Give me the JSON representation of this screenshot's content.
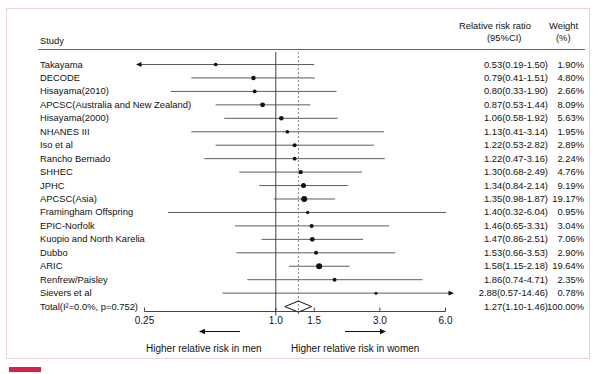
{
  "figure": {
    "column_headers": {
      "study": "Study",
      "effect_line1": "Relative risk ratio",
      "effect_line2": "(95%CI)",
      "weight_line1": "Weight",
      "weight_line2": "(%)"
    },
    "footer": {
      "left_label": "Higher relative risk in men",
      "right_label": "Higher relative risk in women"
    }
  },
  "chart_data": {
    "type": "forest",
    "title": "",
    "xlabel": "",
    "ylabel": "",
    "scale": "log",
    "xlim": [
      0.25,
      6.0
    ],
    "xticks": [
      0.25,
      1.0,
      1.5,
      3.0,
      6.0
    ],
    "xticklabels": [
      "0.25",
      "1.0",
      "1.5",
      "3.0",
      "6.0"
    ],
    "null_line": 1.0,
    "summary_line": 1.27,
    "grid": false,
    "legend": "none",
    "heterogeneity": "I²=0.0%, p=0.752",
    "studies": [
      {
        "label": "Takayama",
        "effect": 0.53,
        "lower": 0.19,
        "upper": 1.5,
        "weight": 1.9,
        "effect_text": "0.53(0.19-1.50)",
        "weight_text": "1.90%"
      },
      {
        "label": "DECODE",
        "effect": 0.79,
        "lower": 0.41,
        "upper": 1.51,
        "weight": 4.8,
        "effect_text": "0.79(0.41-1.51)",
        "weight_text": "4.80%"
      },
      {
        "label": "Hisayama(2010)",
        "effect": 0.8,
        "lower": 0.33,
        "upper": 1.9,
        "weight": 2.66,
        "effect_text": "0.80(0.33-1.90)",
        "weight_text": "2.66%"
      },
      {
        "label": "APCSC(Australia and New Zealand)",
        "effect": 0.87,
        "lower": 0.53,
        "upper": 1.44,
        "weight": 8.09,
        "effect_text": "0.87(0.53-1.44)",
        "weight_text": "8.09%"
      },
      {
        "label": "Hisayama(2000)",
        "effect": 1.06,
        "lower": 0.58,
        "upper": 1.92,
        "weight": 5.63,
        "effect_text": "1.06(0.58-1.92)",
        "weight_text": "5.63%"
      },
      {
        "label": "NHANES III",
        "effect": 1.13,
        "lower": 0.41,
        "upper": 3.14,
        "weight": 1.95,
        "effect_text": "1.13(0.41-3.14)",
        "weight_text": "1.95%"
      },
      {
        "label": "Iso et al",
        "effect": 1.22,
        "lower": 0.53,
        "upper": 2.82,
        "weight": 2.89,
        "effect_text": "1.22(0.53-2.82)",
        "weight_text": "2.89%"
      },
      {
        "label": "Rancho Bernado",
        "effect": 1.22,
        "lower": 0.47,
        "upper": 3.16,
        "weight": 2.24,
        "effect_text": "1.22(0.47-3.16)",
        "weight_text": "2.24%"
      },
      {
        "label": "SHHEC",
        "effect": 1.3,
        "lower": 0.68,
        "upper": 2.49,
        "weight": 4.76,
        "effect_text": "1.30(0.68-2.49)",
        "weight_text": "4.76%"
      },
      {
        "label": "JPHC",
        "effect": 1.34,
        "lower": 0.84,
        "upper": 2.14,
        "weight": 9.19,
        "effect_text": "1.34(0.84-2.14)",
        "weight_text": "9.19%"
      },
      {
        "label": "APCSC(Asia)",
        "effect": 1.35,
        "lower": 0.98,
        "upper": 1.87,
        "weight": 19.17,
        "effect_text": "1.35(0.98-1.87)",
        "weight_text": "19.17%"
      },
      {
        "label": "Framingham Offspring",
        "effect": 1.4,
        "lower": 0.32,
        "upper": 6.04,
        "weight": 0.95,
        "effect_text": "1.40(0.32-6.04)",
        "weight_text": "0.95%"
      },
      {
        "label": "EPIC-Norfolk",
        "effect": 1.46,
        "lower": 0.65,
        "upper": 3.31,
        "weight": 3.04,
        "effect_text": "1.46(0.65-3.31)",
        "weight_text": "3.04%"
      },
      {
        "label": "Kuopio and North Karelia",
        "effect": 1.47,
        "lower": 0.86,
        "upper": 2.51,
        "weight": 7.06,
        "effect_text": "1.47(0.86-2.51)",
        "weight_text": "7.06%"
      },
      {
        "label": "Dubbo",
        "effect": 1.53,
        "lower": 0.66,
        "upper": 3.53,
        "weight": 2.9,
        "effect_text": "1.53(0.66-3.53)",
        "weight_text": "2.90%"
      },
      {
        "label": "ARIC",
        "effect": 1.58,
        "lower": 1.15,
        "upper": 2.18,
        "weight": 19.64,
        "effect_text": "1.58(1.15-2.18)",
        "weight_text": "19.64%"
      },
      {
        "label": "Renfrew/Paisley",
        "effect": 1.86,
        "lower": 0.74,
        "upper": 4.71,
        "weight": 2.35,
        "effect_text": "1.86(0.74-4.71)",
        "weight_text": "2.35%"
      },
      {
        "label": "Sievers et al",
        "effect": 2.88,
        "lower": 0.57,
        "upper": 14.46,
        "weight": 0.78,
        "effect_text": "2.88(0.57-14.46)",
        "weight_text": "0.78%"
      }
    ],
    "total": {
      "label": "Total(I²=0.0%, p=0.752)",
      "effect": 1.27,
      "lower": 1.1,
      "upper": 1.46,
      "weight": 100.0,
      "effect_text": "1.27(1.10-1.46)",
      "weight_text": "100.00%"
    }
  }
}
